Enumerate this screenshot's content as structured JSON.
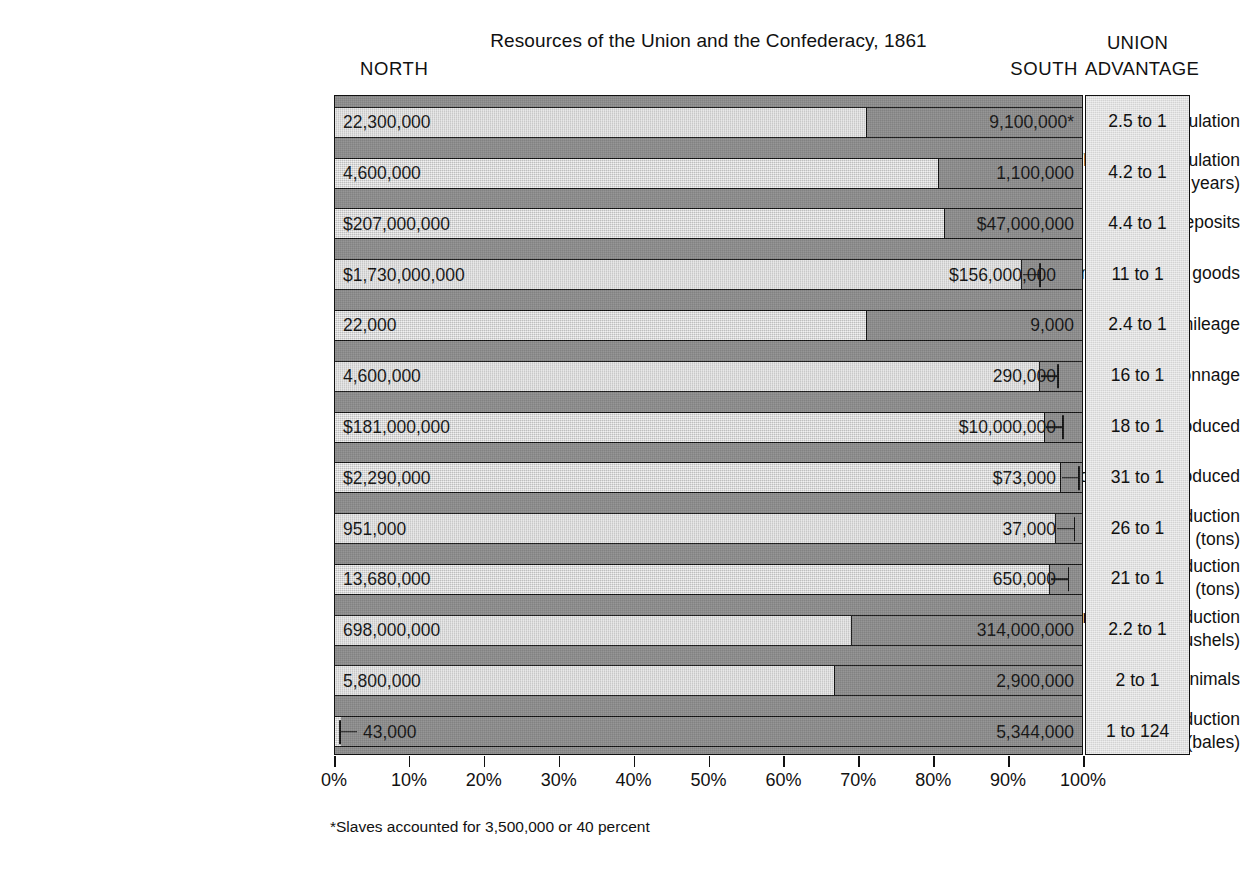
{
  "chart_data": {
    "type": "bar",
    "subtype": "100% stacked horizontal bar",
    "title": "Resources of the Union and the Confederacy, 1861",
    "xlabel": "",
    "ylabel": "",
    "xlim": [
      0,
      100
    ],
    "x_tick_labels": [
      "0%",
      "10%",
      "20%",
      "30%",
      "40%",
      "50%",
      "60%",
      "70%",
      "80%",
      "90%",
      "100%"
    ],
    "x_tick_values": [
      0,
      10,
      20,
      30,
      40,
      50,
      60,
      70,
      80,
      90,
      100
    ],
    "grid": false,
    "legend_position": "column headers",
    "column_headers": {
      "north": "NORTH",
      "south": "SOUTH",
      "advantage_line1": "UNION",
      "advantage_line2": "ADVANTAGE"
    },
    "series": [
      {
        "name": "NORTH",
        "color": "#d7d7d7"
      },
      {
        "name": "SOUTH",
        "color": "#8b8b8b"
      }
    ],
    "footnote": "*Slaves accounted for 3,500,000 or 40 percent",
    "categories": [
      "Total population",
      "White male population (18–45 years)",
      "Bank deposits",
      "Value of manufactured goods",
      "Railroad mileage",
      "Shipping tonnage",
      "Value of textiles produced",
      "Value of firearms produced",
      "Pig iron production (tons)",
      "Coal production (tons)",
      "Corn and wheat production (bushels)",
      "Draft animals",
      "Cotton production (bales)"
    ],
    "rows": [
      {
        "label": "Total population",
        "label_sub": "",
        "north_label": "22,300,000",
        "south_label": "9,100,000*",
        "north_value": 22300000,
        "south_value": 9100000,
        "north_pct": 71.0,
        "south_pct": 29.0,
        "advantage": "2.5 to 1",
        "leader": "none"
      },
      {
        "label": "White male population",
        "label_sub": "(18–45 years)",
        "north_label": "4,600,000",
        "south_label": "1,100,000",
        "north_value": 4600000,
        "south_value": 1100000,
        "north_pct": 80.7,
        "south_pct": 19.3,
        "advantage": "4.2 to 1",
        "leader": "none"
      },
      {
        "label": "Bank deposits",
        "label_sub": "",
        "north_label": "$207,000,000",
        "south_label": "$47,000,000",
        "north_value": 207000000,
        "south_value": 47000000,
        "north_pct": 81.5,
        "south_pct": 18.5,
        "advantage": "4.4 to 1",
        "leader": "none"
      },
      {
        "label": "Value of manufactured goods",
        "label_sub": "",
        "north_label": "$1,730,000,000",
        "south_label": "$156,000,000",
        "north_value": 1730000000,
        "south_value": 156000000,
        "north_pct": 91.7,
        "south_pct": 8.3,
        "advantage": "11 to 1",
        "leader": "right"
      },
      {
        "label": "Railroad mileage",
        "label_sub": "",
        "north_label": "22,000",
        "south_label": "9,000",
        "north_value": 22000,
        "south_value": 9000,
        "north_pct": 71.0,
        "south_pct": 29.0,
        "advantage": "2.4 to 1",
        "leader": "none"
      },
      {
        "label": "Shipping tonnage",
        "label_sub": "",
        "north_label": "4,600,000",
        "south_label": "290,000",
        "north_value": 4600000,
        "south_value": 290000,
        "north_pct": 94.1,
        "south_pct": 5.9,
        "advantage": "16 to 1",
        "leader": "right"
      },
      {
        "label": "Value of textiles produced",
        "label_sub": "",
        "north_label": "$181,000,000",
        "south_label": "$10,000,000",
        "north_value": 181000000,
        "south_value": 10000000,
        "north_pct": 94.8,
        "south_pct": 5.2,
        "advantage": "18 to 1",
        "leader": "right"
      },
      {
        "label": "Value of firearms produced",
        "label_sub": "",
        "north_label": "$2,290,000",
        "south_label": "$73,000",
        "north_value": 2290000,
        "south_value": 73000,
        "north_pct": 96.9,
        "south_pct": 3.1,
        "advantage": "31 to 1",
        "leader": "right"
      },
      {
        "label": "Pig iron production",
        "label_sub": "(tons)",
        "north_label": "951,000",
        "south_label": "37,000",
        "north_value": 951000,
        "south_value": 37000,
        "north_pct": 96.3,
        "south_pct": 3.7,
        "advantage": "26 to 1",
        "leader": "right"
      },
      {
        "label": "Coal production",
        "label_sub": "(tons)",
        "north_label": "13,680,000",
        "south_label": "650,000",
        "north_value": 13680000,
        "south_value": 650000,
        "north_pct": 95.5,
        "south_pct": 4.5,
        "advantage": "21 to 1",
        "leader": "right"
      },
      {
        "label": "Corn and wheat production",
        "label_sub": "(bushels)",
        "north_label": "698,000,000",
        "south_label": "314,000,000",
        "north_value": 698000000,
        "south_value": 314000000,
        "north_pct": 69.0,
        "south_pct": 31.0,
        "advantage": "2.2 to 1",
        "leader": "none"
      },
      {
        "label": "Draft animals",
        "label_sub": "",
        "north_label": "5,800,000",
        "south_label": "2,900,000",
        "north_value": 5800000,
        "south_value": 2900000,
        "north_pct": 66.7,
        "south_pct": 33.3,
        "advantage": "2 to 1",
        "leader": "none"
      },
      {
        "label": "Cotton production",
        "label_sub": "(bales)",
        "north_label": "43,000",
        "south_label": "5,344,000",
        "north_value": 43000,
        "south_value": 5344000,
        "north_pct": 0.8,
        "south_pct": 99.2,
        "advantage": "1 to 124",
        "leader": "left"
      }
    ]
  }
}
